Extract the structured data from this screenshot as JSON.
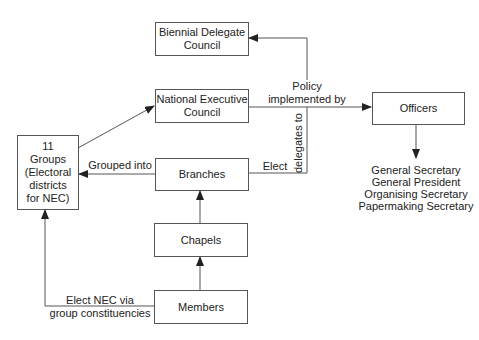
{
  "nodes": {
    "biennial": "Biennial Delegate\nCouncil",
    "nec": "National Executive\nCouncil",
    "officers": "Officers",
    "groups": "11\nGroups\n(Electoral\ndistricts\nfor NEC)",
    "branches": "Branches",
    "chapels": "Chapels",
    "members": "Members"
  },
  "edge_labels": {
    "policy": "Policy\nimplemented by",
    "delegates": "delegates to",
    "elect": "Elect",
    "grouped": "Grouped into",
    "elect_nec": "Elect NEC via\ngroup constituencies"
  },
  "officer_roles": [
    "General Secretary",
    "General President",
    "Organising Secretary",
    "Papermaking Secretary"
  ]
}
